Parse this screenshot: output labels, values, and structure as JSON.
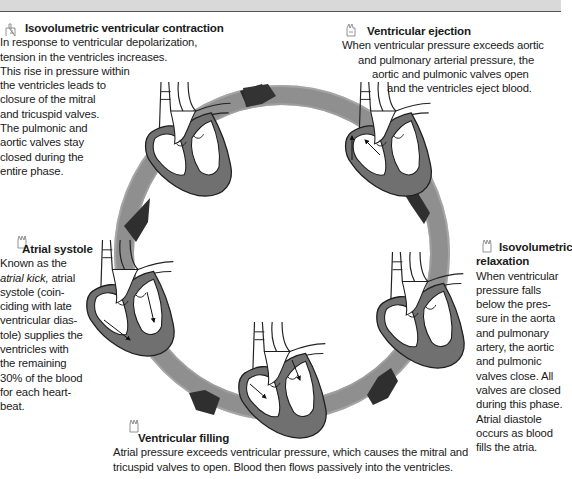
{
  "figure": {
    "colors": {
      "ring": "#8a8a8a",
      "ring_dark": "#2a2a2a",
      "heart_wall": "#6f6f6f",
      "text": "#1a1a1a",
      "top_bar": "#d9d9d9"
    },
    "phases": [
      {
        "id": "isovolumetric-contraction",
        "heading": "Isovolumetric ventricular contraction",
        "icon": "hand-icon",
        "lines": [
          "In response to ventricular depolarization,",
          "tension in the ventricles increases.",
          "This rise in pressure within",
          "the ventricles leads to",
          "closure of the mitral",
          "and tricuspid valves.",
          "The pulmonic and",
          "aortic valves stay",
          "closed during the",
          "entire phase."
        ]
      },
      {
        "id": "ventricular-ejection",
        "heading": "Ventricular ejection",
        "icon": "hand-icon",
        "lines": [
          "When ventricular pressure exceeds aortic",
          "and pulmonary arterial pressure, the",
          "aortic and pulmonic valves open",
          "and the ventricles eject blood."
        ]
      },
      {
        "id": "isovolumetric-relaxation",
        "heading_line1": "Isovolumetric",
        "heading_line2": "relaxation",
        "icon": "hand-icon",
        "lines": [
          "When ventricular",
          "pressure falls",
          "below the pres-",
          "sure in the aorta",
          "and pulmonary",
          "artery, the aortic",
          "and pulmonic",
          "valves close. All",
          "valves are closed",
          "during this phase.",
          "Atrial diastole",
          "occurs as blood",
          "fills the atria."
        ]
      },
      {
        "id": "ventricular-filling",
        "heading": "Ventricular filling",
        "icon": "hand-icon",
        "lines": [
          "Atrial pressure exceeds ventricular pressure, which causes the mitral and",
          "tricuspid valves to open. Blood then flows passively into the ventricles."
        ]
      },
      {
        "id": "atrial-systole",
        "heading": "Atrial systole",
        "icon": "hand-icon",
        "line1": "Known as the",
        "line2_em": "atrial kick,",
        "line2_rest": " atrial",
        "lines": [
          "systole (coin-",
          "ciding with late",
          "ventricular dias-",
          "tole) supplies the",
          "ventricles with",
          "the remaining",
          "30% of the blood",
          "for each heart-",
          "beat."
        ]
      }
    ]
  }
}
